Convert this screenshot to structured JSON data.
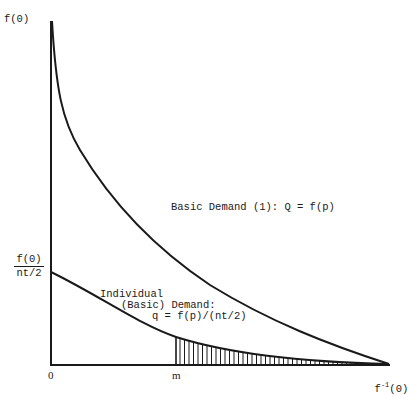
{
  "chart_data": {
    "type": "line",
    "title": "",
    "xlabel": "",
    "ylabel": "",
    "axes": {
      "y_tick_labels": [
        "f(0)",
        "f(0) / nt/2"
      ],
      "x_tick_labels": [
        "0",
        "m",
        "f⁻¹(0)"
      ]
    },
    "series": [
      {
        "name": "Basic Demand (1): Q = f(p)",
        "description": "Convex decreasing curve from f(0) at x=0 to zero at f⁻¹(0)"
      },
      {
        "name": "Individual (Basic) Demand: q = f(p)/(nt/2)",
        "description": "Convex decreasing curve from f(0)/(nt/2) at x=0 to zero at f⁻¹(0)"
      }
    ],
    "shaded_region": {
      "description": "Vertically hatched area under the individual demand curve from m to f⁻¹(0)",
      "from": "m",
      "to": "f⁻¹(0)"
    },
    "grid": false,
    "legend": "none (inline labels)"
  },
  "labels": {
    "y_top": "f(0)",
    "y_mid_num": "f(0)",
    "y_mid_den": "nt/2",
    "x_origin": "0",
    "x_m": "m",
    "x_end_base": "f",
    "x_end_sup": "-1",
    "x_end_arg": "(0)",
    "basic_demand": "Basic Demand (1): Q = f(p)",
    "individual_line1": "Individual",
    "individual_line2": "(Basic) Demand:",
    "individual_line3": "q = f(p)/(nt/2)"
  },
  "colors": {
    "ink": "#1a1a1a",
    "background": "#ffffff"
  }
}
